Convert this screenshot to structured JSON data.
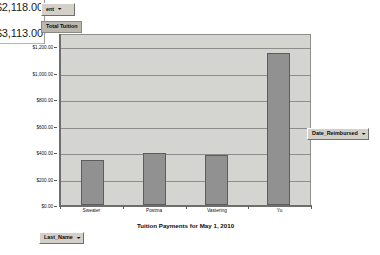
{
  "datasheet": {
    "values": [
      "$2,118.00",
      "$3,113.00"
    ]
  },
  "fields": {
    "page_field": "ent",
    "series_field": "Total Tuition",
    "column_field": "Date_Reimbursed",
    "row_field": "Last_Name",
    "dropdown_arrow": "▾"
  },
  "chart_data": {
    "type": "bar",
    "title": "Tuition Payments for May 1, 2010",
    "xlabel": "",
    "ylabel": "",
    "categories": [
      "Sweater",
      "Postma",
      "Vastering",
      "Yu"
    ],
    "values": [
      340,
      395,
      380,
      1150
    ],
    "value_labels": [
      "$340.00",
      "$395.00",
      "$380.00",
      "$1,150.00"
    ],
    "series": [
      {
        "name": "Total Tuition",
        "values": [
          340,
          395,
          380,
          1150
        ]
      }
    ],
    "ylim": [
      0,
      1300
    ],
    "ytick_values": [
      0,
      200,
      400,
      600,
      800,
      1000,
      1200
    ],
    "ytick_labels": [
      "$0.00",
      "$200.00",
      "$400.00",
      "$600.00",
      "$800.00",
      "$1,000.00",
      "$1,200.00"
    ],
    "grid": true,
    "legend": false,
    "bar_color": "#919191",
    "plot_background": "#d4d4d0"
  }
}
